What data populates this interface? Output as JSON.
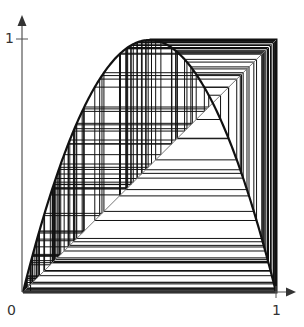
{
  "diagram": {
    "type": "cobweb",
    "map": "logistic",
    "r": 4.0,
    "x0": 0.03,
    "iterations": 120,
    "axes": {
      "origin_label": "0",
      "x_end_label": "1",
      "y_end_label": "1",
      "xlim": [
        0,
        1
      ],
      "ylim": [
        0,
        1
      ]
    },
    "curves": [
      {
        "name": "parabola",
        "expr": "f(x) = r x (1 - x)"
      },
      {
        "name": "diagonal",
        "expr": "y = x"
      }
    ],
    "colors": {
      "ink": "#111111",
      "axis": "#555555",
      "diagonal": "#777777"
    }
  }
}
